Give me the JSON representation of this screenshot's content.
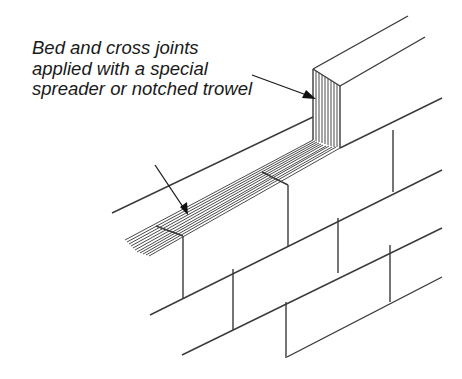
{
  "figure": {
    "type": "technical-illustration"
  },
  "annotation": {
    "lines": [
      "Bed and cross joints",
      "applied with a special",
      "spreader or notched trowel"
    ]
  },
  "colors": {
    "line": "#3a3a3a",
    "text": "#1a1a1a",
    "background": "#ffffff"
  }
}
